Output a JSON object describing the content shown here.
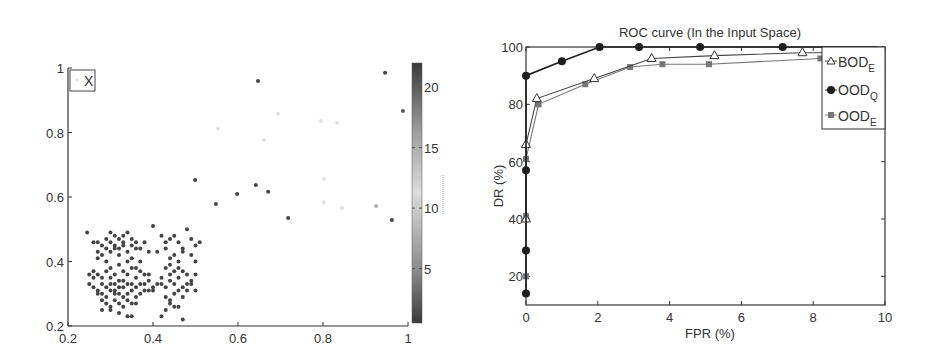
{
  "chart_data": [
    {
      "type": "scatter",
      "title": "",
      "xlabel": "",
      "ylabel": "",
      "xlim": [
        0.2,
        1.0
      ],
      "ylim": [
        0.2,
        1.0
      ],
      "xticks": [
        "0.2",
        "0.4",
        "0.6",
        "0.8",
        "1"
      ],
      "yticks": [
        "0.2",
        "0.4",
        "0.6",
        "0.8",
        "1"
      ],
      "grid": false,
      "legend": {
        "entries": [
          "X"
        ],
        "position": "upper-left"
      },
      "colorbar": {
        "range": [
          0.5,
          22
        ],
        "ticks": [
          "5",
          "10",
          "15",
          "20"
        ],
        "colormap": "dark-light-dark gray"
      },
      "sparse_points": [
        {
          "x": 0.647,
          "y": 0.96,
          "c": 21
        },
        {
          "x": 0.946,
          "y": 0.985,
          "c": 21
        },
        {
          "x": 0.988,
          "y": 0.867,
          "c": 20
        },
        {
          "x": 0.553,
          "y": 0.812,
          "c": 12
        },
        {
          "x": 0.694,
          "y": 0.858,
          "c": 12
        },
        {
          "x": 0.795,
          "y": 0.836,
          "c": 12
        },
        {
          "x": 0.833,
          "y": 0.83,
          "c": 12
        },
        {
          "x": 0.661,
          "y": 0.777,
          "c": 12
        },
        {
          "x": 0.499,
          "y": 0.653,
          "c": 21
        },
        {
          "x": 0.548,
          "y": 0.578,
          "c": 21
        },
        {
          "x": 0.598,
          "y": 0.609,
          "c": 21
        },
        {
          "x": 0.642,
          "y": 0.637,
          "c": 21
        },
        {
          "x": 0.671,
          "y": 0.616,
          "c": 21
        },
        {
          "x": 0.802,
          "y": 0.656,
          "c": 12
        },
        {
          "x": 0.802,
          "y": 0.584,
          "c": 12
        },
        {
          "x": 0.845,
          "y": 0.566,
          "c": 12
        },
        {
          "x": 0.925,
          "y": 0.572,
          "c": 15
        },
        {
          "x": 0.962,
          "y": 0.529,
          "c": 21
        },
        {
          "x": 0.718,
          "y": 0.535,
          "c": 21
        }
      ],
      "cluster": {
        "x_range": [
          0.24,
          0.52
        ],
        "y_range": [
          0.22,
          0.51
        ],
        "approx_count": 260,
        "c": 21,
        "points": [
          [
            0.245,
            0.49
          ],
          [
            0.26,
            0.46
          ],
          [
            0.27,
            0.43
          ],
          [
            0.28,
            0.45
          ],
          [
            0.29,
            0.47
          ],
          [
            0.3,
            0.49
          ],
          [
            0.31,
            0.48
          ],
          [
            0.32,
            0.47
          ],
          [
            0.33,
            0.46
          ],
          [
            0.34,
            0.49
          ],
          [
            0.35,
            0.47
          ],
          [
            0.36,
            0.46
          ],
          [
            0.37,
            0.44
          ],
          [
            0.38,
            0.46
          ],
          [
            0.39,
            0.43
          ],
          [
            0.27,
            0.41
          ],
          [
            0.28,
            0.42
          ],
          [
            0.29,
            0.4
          ],
          [
            0.3,
            0.43
          ],
          [
            0.31,
            0.44
          ],
          [
            0.32,
            0.42
          ],
          [
            0.33,
            0.45
          ],
          [
            0.34,
            0.43
          ],
          [
            0.35,
            0.41
          ],
          [
            0.36,
            0.44
          ],
          [
            0.37,
            0.4
          ],
          [
            0.26,
            0.37
          ],
          [
            0.27,
            0.36
          ],
          [
            0.28,
            0.35
          ],
          [
            0.29,
            0.37
          ],
          [
            0.3,
            0.38
          ],
          [
            0.31,
            0.36
          ],
          [
            0.32,
            0.34
          ],
          [
            0.33,
            0.37
          ],
          [
            0.34,
            0.36
          ],
          [
            0.35,
            0.38
          ],
          [
            0.36,
            0.35
          ],
          [
            0.37,
            0.37
          ],
          [
            0.38,
            0.36
          ],
          [
            0.39,
            0.34
          ],
          [
            0.25,
            0.33
          ],
          [
            0.26,
            0.32
          ],
          [
            0.27,
            0.31
          ],
          [
            0.28,
            0.3
          ],
          [
            0.29,
            0.32
          ],
          [
            0.3,
            0.31
          ],
          [
            0.31,
            0.33
          ],
          [
            0.32,
            0.3
          ],
          [
            0.33,
            0.32
          ],
          [
            0.34,
            0.33
          ],
          [
            0.35,
            0.31
          ],
          [
            0.36,
            0.32
          ],
          [
            0.37,
            0.3
          ],
          [
            0.38,
            0.33
          ],
          [
            0.39,
            0.31
          ],
          [
            0.4,
            0.32
          ],
          [
            0.41,
            0.33
          ],
          [
            0.28,
            0.28
          ],
          [
            0.29,
            0.27
          ],
          [
            0.3,
            0.26
          ],
          [
            0.31,
            0.28
          ],
          [
            0.32,
            0.27
          ],
          [
            0.33,
            0.29
          ],
          [
            0.34,
            0.28
          ],
          [
            0.35,
            0.27
          ],
          [
            0.36,
            0.29
          ],
          [
            0.28,
            0.25
          ],
          [
            0.3,
            0.25
          ],
          [
            0.32,
            0.24
          ],
          [
            0.34,
            0.23
          ],
          [
            0.35,
            0.23
          ],
          [
            0.33,
            0.26
          ],
          [
            0.31,
            0.31
          ],
          [
            0.3,
            0.35
          ],
          [
            0.32,
            0.39
          ],
          [
            0.34,
            0.4
          ],
          [
            0.36,
            0.38
          ],
          [
            0.33,
            0.34
          ],
          [
            0.35,
            0.33
          ],
          [
            0.31,
            0.45
          ],
          [
            0.29,
            0.44
          ],
          [
            0.27,
            0.46
          ],
          [
            0.33,
            0.48
          ],
          [
            0.35,
            0.45
          ],
          [
            0.3,
            0.46
          ],
          [
            0.32,
            0.44
          ],
          [
            0.25,
            0.36
          ],
          [
            0.26,
            0.35
          ],
          [
            0.27,
            0.3
          ],
          [
            0.29,
            0.29
          ],
          [
            0.37,
            0.33
          ],
          [
            0.38,
            0.31
          ],
          [
            0.39,
            0.36
          ],
          [
            0.4,
            0.31
          ],
          [
            0.36,
            0.27
          ],
          [
            0.34,
            0.3
          ],
          [
            0.32,
            0.32
          ],
          [
            0.3,
            0.33
          ],
          [
            0.28,
            0.33
          ],
          [
            0.31,
            0.3
          ],
          [
            0.4,
            0.51
          ],
          [
            0.42,
            0.48
          ],
          [
            0.43,
            0.46
          ],
          [
            0.44,
            0.47
          ],
          [
            0.45,
            0.48
          ],
          [
            0.46,
            0.46
          ],
          [
            0.47,
            0.44
          ],
          [
            0.48,
            0.5
          ],
          [
            0.49,
            0.47
          ],
          [
            0.5,
            0.45
          ],
          [
            0.51,
            0.46
          ],
          [
            0.41,
            0.43
          ],
          [
            0.43,
            0.44
          ],
          [
            0.44,
            0.41
          ],
          [
            0.45,
            0.42
          ],
          [
            0.46,
            0.4
          ],
          [
            0.47,
            0.43
          ],
          [
            0.49,
            0.42
          ],
          [
            0.5,
            0.4
          ],
          [
            0.42,
            0.35
          ],
          [
            0.43,
            0.38
          ],
          [
            0.44,
            0.36
          ],
          [
            0.45,
            0.37
          ],
          [
            0.46,
            0.35
          ],
          [
            0.47,
            0.37
          ],
          [
            0.48,
            0.36
          ],
          [
            0.49,
            0.34
          ],
          [
            0.5,
            0.36
          ],
          [
            0.42,
            0.33
          ],
          [
            0.43,
            0.32
          ],
          [
            0.44,
            0.34
          ],
          [
            0.45,
            0.33
          ],
          [
            0.46,
            0.31
          ],
          [
            0.47,
            0.32
          ],
          [
            0.48,
            0.31
          ],
          [
            0.49,
            0.33
          ],
          [
            0.5,
            0.31
          ],
          [
            0.43,
            0.29
          ],
          [
            0.44,
            0.28
          ],
          [
            0.45,
            0.26
          ],
          [
            0.44,
            0.27
          ],
          [
            0.46,
            0.26
          ],
          [
            0.43,
            0.25
          ],
          [
            0.42,
            0.23
          ],
          [
            0.47,
            0.22
          ],
          [
            0.45,
            0.3
          ],
          [
            0.46,
            0.38
          ],
          [
            0.44,
            0.39
          ],
          [
            0.48,
            0.33
          ],
          [
            0.47,
            0.29
          ]
        ]
      }
    },
    {
      "type": "line",
      "title": "ROC curve (In the Input Space)",
      "xlabel": "FPR (%)",
      "ylabel": "DR (%)",
      "xlim": [
        0,
        10
      ],
      "ylim": [
        10,
        100
      ],
      "xticks": [
        "0",
        "2",
        "4",
        "6",
        "8",
        "10"
      ],
      "yticks": [
        "20",
        "40",
        "60",
        "80",
        "100"
      ],
      "grid": false,
      "legend": {
        "position": "upper-right"
      },
      "series": [
        {
          "name": "BOD_E",
          "label_main": "BOD",
          "label_sub": "E",
          "marker": "triangle",
          "color": "#444444",
          "x": [
            0,
            0,
            0.3,
            1.9,
            3.5,
            5.25,
            7.7,
            10
          ],
          "y": [
            40,
            66,
            82,
            89,
            96,
            97,
            98,
            98
          ]
        },
        {
          "name": "OOD_Q",
          "label_main": "OOD",
          "label_sub": "Q",
          "marker": "circle",
          "color": "#1e1e1e",
          "x": [
            0,
            0,
            0,
            0,
            1.0,
            2.05,
            3.15,
            4.85,
            7.15,
            10
          ],
          "y": [
            14,
            29,
            57,
            90,
            95,
            100,
            100,
            100,
            100,
            100
          ]
        },
        {
          "name": "OOD_E",
          "label_main": "OOD",
          "label_sub": "E",
          "marker": "square",
          "color": "#777777",
          "x": [
            0,
            0,
            0,
            0.35,
            1.65,
            2.9,
            3.8,
            5.1,
            8.2,
            10
          ],
          "y": [
            20,
            41,
            61,
            80,
            87,
            93,
            94,
            94,
            96,
            96
          ]
        }
      ]
    }
  ],
  "scatter": {
    "legend_label": "X",
    "xticks": [
      "0.2",
      "0.4",
      "0.6",
      "0.8",
      "1"
    ],
    "yticks": [
      "0.2",
      "0.4",
      "0.6",
      "0.8",
      "1"
    ],
    "colorbar_ticks": [
      "5",
      "10",
      "15",
      "20"
    ]
  },
  "roc": {
    "title": "ROC curve (In the Input Space)",
    "xlabel": "FPR (%)",
    "ylabel": "DR (%)",
    "xticks": [
      "0",
      "2",
      "4",
      "6",
      "8",
      "10"
    ],
    "yticks": [
      "20",
      "40",
      "60",
      "80",
      "100"
    ],
    "legend": [
      {
        "main": "BOD",
        "sub": "E"
      },
      {
        "main": "OOD",
        "sub": "Q"
      },
      {
        "main": "OOD",
        "sub": "E"
      }
    ]
  }
}
